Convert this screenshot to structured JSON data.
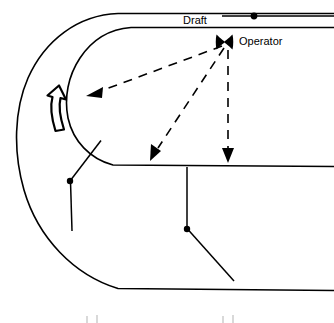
{
  "figure": {
    "background_color": "#ffffff",
    "line_color": "#000000",
    "width": 334,
    "height": 323
  },
  "labels": {
    "draft": "Draft",
    "operator": "Operator"
  },
  "icons": {
    "operator_marker": "x-bowtie-icon",
    "draft_marker": "dot-marker-icon",
    "rotation_arrow": "curved-up-arrow-icon"
  },
  "flow_arrows": [
    {
      "name": "arrow-to-left-wall",
      "direction": "left",
      "style": "dashed"
    },
    {
      "name": "arrow-to-lower-left",
      "direction": "down-left",
      "style": "dashed"
    },
    {
      "name": "arrow-to-bottom",
      "direction": "down",
      "style": "dashed"
    }
  ],
  "geometry": {
    "outer_wall": "M 334 14 L 117 14 C 52 18 14 70 14 140 C 14 216 58 272 120 288 L 334 290",
    "inner_wall": "M 334 27 L 128 27 C 88 30 62 68 62 104 C 62 140 88 164 128 166 L 334 166",
    "draft_line_top_y": 14,
    "draft_line_bottom_y": 27,
    "mid_line_y": 166,
    "bottom_line_y": 290
  },
  "nodes": [
    {
      "name": "draft-dot",
      "x": 254,
      "y": 16
    },
    {
      "name": "operator-cross",
      "x": 224,
      "y": 42
    },
    {
      "name": "left-probe-joint",
      "x": 70,
      "y": 181
    },
    {
      "name": "right-probe-joint",
      "x": 187,
      "y": 229
    }
  ],
  "probes": [
    {
      "name": "left-probe",
      "path": "M 102 141 L 70 181 L 72 231"
    },
    {
      "name": "right-probe",
      "path": "M 187 166 L 187 229 L 234 281"
    }
  ],
  "bottom_marks": [
    {
      "name": "bottom-artifact-left"
    },
    {
      "name": "bottom-artifact-right"
    }
  ]
}
